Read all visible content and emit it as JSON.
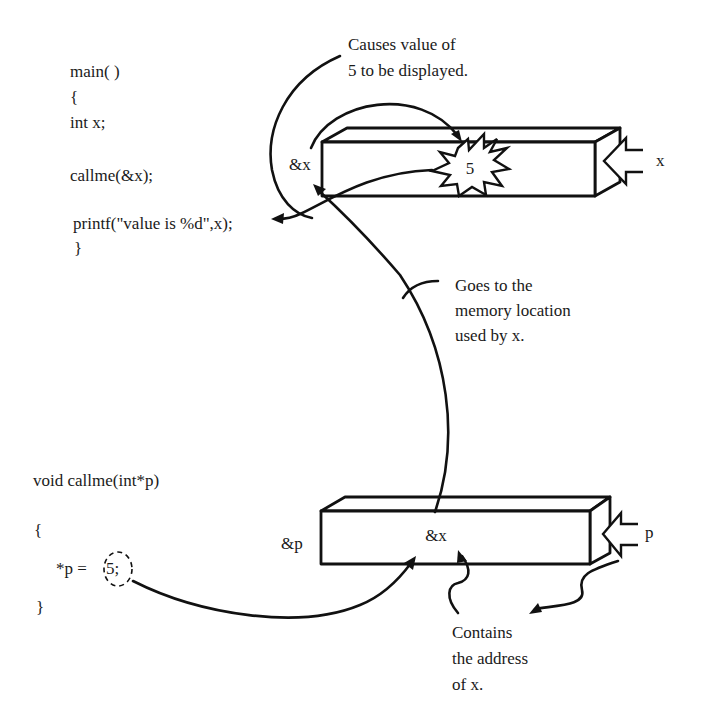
{
  "main_code": {
    "lines": [
      "main( )",
      "{",
      "int x;",
      "",
      "callme(&x);",
      "",
      "printf(\"value is %d\",x);",
      "}"
    ]
  },
  "callme_code": {
    "signature": "void callme(int*p)",
    "open_brace": "{",
    "statement_prefix": "*p = ",
    "statement_value": "5;",
    "close_brace": "}"
  },
  "top_box": {
    "address_label": "&x",
    "value": "5",
    "name_label": "x"
  },
  "bottom_box": {
    "address_label": "&p",
    "value": "&x",
    "name_label": "p"
  },
  "annotations": {
    "displayed": [
      "Causes value of",
      "5 to be displayed."
    ],
    "goes_to": [
      "Goes to the",
      "memory location",
      "used by x."
    ],
    "contains": [
      "Contains",
      "the address",
      "of x."
    ]
  }
}
